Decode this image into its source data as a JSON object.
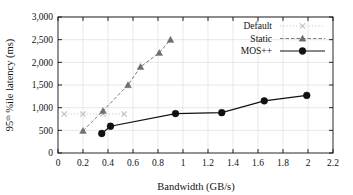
{
  "chart_data": {
    "type": "line",
    "title": "",
    "xlabel": "Bandwidth (GB/s)",
    "ylabel_main": "95",
    "ylabel_sup": "th",
    "ylabel_rest": " %ile latency (ms)",
    "ylabel_full": "95th %ile latency (ms)",
    "xlim": [
      0,
      2.2
    ],
    "ylim": [
      0,
      3000
    ],
    "xticks": [
      "0",
      "0.2",
      "0.4",
      "0.6",
      "0.8",
      "1",
      "1.2",
      "1.4",
      "1.6",
      "1.8",
      "2",
      "2.2"
    ],
    "xtick_values": [
      0,
      0.2,
      0.4,
      0.6,
      0.8,
      1.0,
      1.2,
      1.4,
      1.6,
      1.8,
      2.0,
      2.2
    ],
    "yticks": [
      "0",
      "500",
      "1,000",
      "1,500",
      "2,000",
      "2,500",
      "3,000"
    ],
    "ytick_values": [
      0,
      500,
      1000,
      1500,
      2000,
      2500,
      3000
    ],
    "grid": true,
    "legend_position": "top-right",
    "series": [
      {
        "name": "Default",
        "marker": "cross",
        "color": "#bdbdbd",
        "linestyle": "dotted",
        "points": [
          {
            "x": 0.05,
            "y": 860
          },
          {
            "x": 0.2,
            "y": 860
          },
          {
            "x": 0.36,
            "y": 860
          },
          {
            "x": 0.53,
            "y": 860
          }
        ]
      },
      {
        "name": "Static",
        "marker": "triangle",
        "color": "#6e6e6e",
        "linestyle": "dashed",
        "points": [
          {
            "x": 0.2,
            "y": 490
          },
          {
            "x": 0.36,
            "y": 930
          },
          {
            "x": 0.56,
            "y": 1500
          },
          {
            "x": 0.66,
            "y": 1900
          },
          {
            "x": 0.81,
            "y": 2210
          },
          {
            "x": 0.9,
            "y": 2500
          }
        ]
      },
      {
        "name": "MOS++",
        "marker": "circle",
        "color": "#111111",
        "linestyle": "solid",
        "points": [
          {
            "x": 0.35,
            "y": 430
          },
          {
            "x": 0.42,
            "y": 590
          },
          {
            "x": 0.94,
            "y": 870
          },
          {
            "x": 1.31,
            "y": 890
          },
          {
            "x": 1.65,
            "y": 1150
          },
          {
            "x": 1.99,
            "y": 1270
          }
        ]
      }
    ]
  },
  "legend": {
    "items": [
      {
        "label": "Default"
      },
      {
        "label": "Static"
      },
      {
        "label": "MOS++"
      }
    ]
  }
}
